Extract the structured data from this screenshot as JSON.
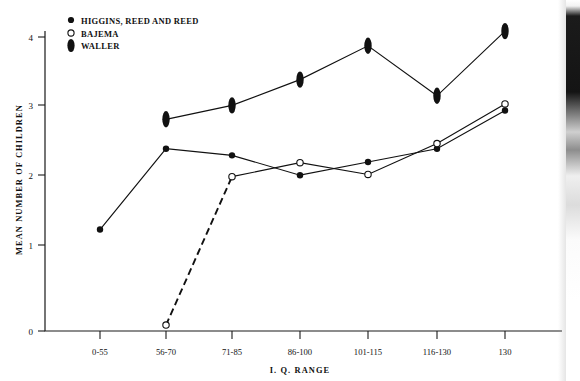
{
  "chart_data": {
    "type": "line",
    "title": "",
    "xlabel": "I. Q. RANGE",
    "ylabel": "MEAN NUMBER OF CHILDREN",
    "categories": [
      "0-55",
      "56-70",
      "71-85",
      "86-100",
      "101-115",
      "116-130",
      "130"
    ],
    "ylim": [
      0,
      4.35
    ],
    "yticks": [
      0,
      1,
      2,
      3,
      4
    ],
    "ytick_labels": [
      "0",
      "1",
      "2",
      "3",
      "4"
    ],
    "grid": false,
    "legend_position": "top-left",
    "series": [
      {
        "name": "HIGGINS, REED AND REED",
        "marker": "filled-circle",
        "line_style": "solid",
        "color": "#111111",
        "values": [
          1.38,
          2.48,
          2.39,
          2.12,
          2.3,
          2.48,
          3.0
        ]
      },
      {
        "name": "BAJEMA",
        "marker": "open-circle",
        "line_style": "dashed-then-solid",
        "color": "#111111",
        "values": [
          null,
          0.08,
          2.1,
          2.29,
          2.13,
          2.55,
          3.09
        ]
      },
      {
        "name": "WALLER",
        "marker": "filled-ellipse",
        "line_style": "solid",
        "color": "#111111",
        "values": [
          null,
          2.88,
          3.07,
          3.42,
          3.88,
          3.2,
          4.08
        ]
      }
    ]
  },
  "legend": {
    "items": [
      {
        "label": "HIGGINS, REED AND REED",
        "marker": "filled-circle"
      },
      {
        "label": "BAJEMA",
        "marker": "open-circle"
      },
      {
        "label": "WALLER",
        "marker": "filled-ellipse"
      }
    ]
  },
  "axes": {
    "y_title": "MEAN NUMBER OF CHILDREN",
    "x_title": "I. Q. RANGE",
    "y_tick_labels": [
      "0",
      "1",
      "2",
      "3",
      "4"
    ],
    "x_tick_labels": [
      "0-55",
      "56-70",
      "71-85",
      "86-100",
      "101-115",
      "116-130",
      "130"
    ]
  }
}
